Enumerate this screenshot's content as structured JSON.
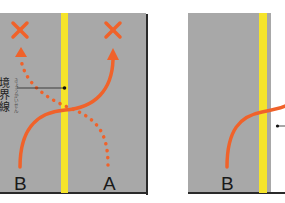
{
  "colors": {
    "road": "#a8a8a8",
    "center_line": "#f5e42a",
    "path": "#f0622a",
    "border": "#2a2a2a",
    "shoulder": "#ffffff"
  },
  "left_panel": {
    "boundary_label": "境界線",
    "boundary_ruby": "きょうかいせん",
    "label_b": "B",
    "label_a": "A",
    "forbidden_marks": [
      "x-mark",
      "x-mark"
    ]
  },
  "right_panel": {
    "label_b": "B"
  }
}
